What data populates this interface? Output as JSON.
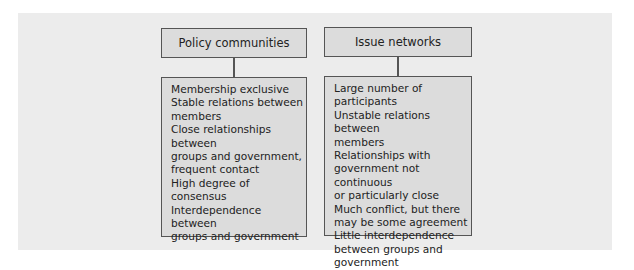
{
  "diagram": {
    "left": {
      "title": "Policy communities",
      "items": [
        "Membership exclusive",
        "Stable relations between members",
        "Close relationships between groups and government, frequent contact",
        "High degree of consensus",
        "Interdependence between groups and government"
      ],
      "lines": [
        "Membership exclusive",
        "Stable relations between",
        "members",
        "Close relationships between",
        "groups and government,",
        "frequent contact",
        "High degree of consensus",
        "Interdependence between",
        "groups and government"
      ]
    },
    "right": {
      "title": "Issue networks",
      "items": [
        "Large number of participants",
        "Unstable relations between members",
        "Relationships with government not continuous or particularly close",
        "Much conflict, but there may be some agreement",
        "Little interdependence between groups and government"
      ],
      "lines": [
        "Large number of participants",
        "Unstable relations between",
        "members",
        "Relationships with",
        "government not continuous",
        "or particularly close",
        "Much conflict, but there",
        "may be some agreement",
        "Little interdependence",
        "between groups and",
        "government"
      ]
    },
    "colors": {
      "panel_bg": "#ececec",
      "box_bg": "#dcdcdc",
      "border": "#555555",
      "text": "#222222"
    }
  }
}
